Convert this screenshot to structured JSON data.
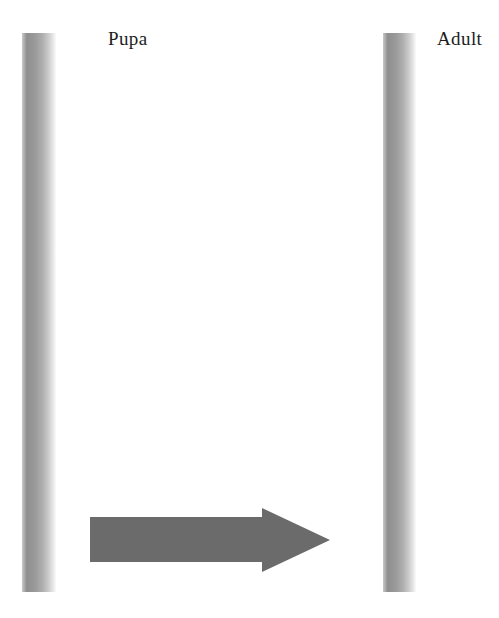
{
  "figure": {
    "type": "life-cycle-transition-diagram",
    "background_color": "#ffffff",
    "columns": [
      {
        "name": "left-column-divider",
        "label": "Pupa",
        "bar_color_dark": "#8f8f8f",
        "bar_color_light": "#fbfbfb"
      },
      {
        "name": "right-column-divider",
        "label": "Adult",
        "bar_color_dark": "#8f8f8f",
        "bar_color_light": "#fbfbfb"
      }
    ],
    "arrow": {
      "name": "transition-arrow",
      "direction": "right",
      "color": "#6b6b6b",
      "from_stage": "Pupa",
      "to_stage": "Adult"
    }
  },
  "labels": {
    "pupa": "Pupa",
    "adult": "Adult"
  }
}
